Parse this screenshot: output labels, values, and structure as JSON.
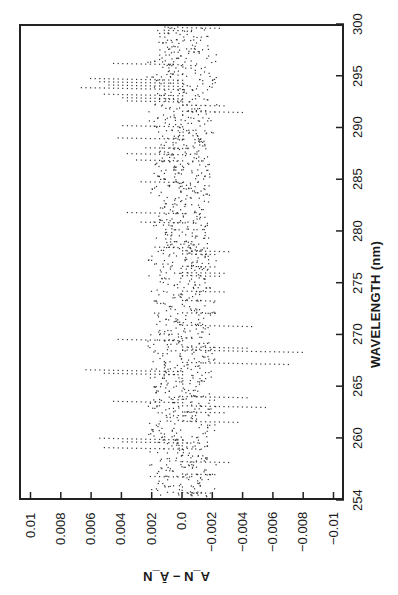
{
  "chart_data": {
    "type": "scatter",
    "orientation": "rotated-90 (wavelength axis vertical on right, residual axis horizontal along bottom)",
    "title": "",
    "xlabel": "WAVELENGTH (nm)",
    "ylabel": "A_N − Ā_N",
    "xlim": [
      254,
      300
    ],
    "ylim": [
      -0.011,
      0.011
    ],
    "x_ticks": [
      254,
      260,
      265,
      270,
      275,
      280,
      285,
      290,
      295,
      300
    ],
    "x_tick_labels": [
      "254",
      "260",
      "265",
      "270",
      "275",
      "280",
      "285",
      "290",
      "295",
      "300"
    ],
    "y_ticks": [
      0.01,
      0.008,
      0.006,
      0.004,
      0.002,
      0.0,
      -0.002,
      -0.004,
      -0.006,
      -0.008,
      -0.01
    ],
    "y_tick_labels": [
      "0.01",
      "0.008",
      "0.006",
      "0.004",
      "0.002",
      "0.0",
      "−0.002",
      "−0.004",
      "−0.006",
      "−0.008",
      "−0.01"
    ],
    "grid": false,
    "legend": null,
    "marker": "small dots",
    "series": [
      {
        "name": "residuals",
        "description": "dense noisy dotted residual scatter centered near 0.0, with horizontal spike lines of dots",
        "envelope": {
          "wavelength": [
            254,
            256,
            258,
            260,
            262,
            265,
            268,
            270,
            272,
            275,
            278,
            280,
            283,
            285,
            288,
            290,
            293,
            295,
            297,
            300
          ],
          "max": [
            0.002,
            0.0045,
            0.006,
            0.0065,
            0.0055,
            0.008,
            0.006,
            0.005,
            0.0045,
            0.003,
            0.0035,
            0.004,
            0.006,
            0.004,
            0.005,
            0.0045,
            0.006,
            0.0105,
            0.005,
            0.001
          ],
          "min": [
            -0.003,
            -0.0045,
            -0.004,
            -0.011,
            -0.006,
            -0.005,
            -0.009,
            -0.006,
            -0.004,
            -0.003,
            -0.0035,
            -0.004,
            -0.0035,
            -0.004,
            -0.005,
            -0.0045,
            -0.005,
            -0.011,
            -0.0085,
            -0.002
          ]
        }
      }
    ]
  }
}
